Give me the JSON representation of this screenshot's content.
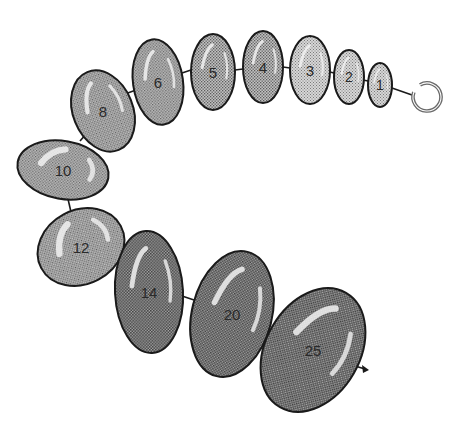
{
  "diagram": {
    "type": "bead-chain",
    "colors": {
      "outline": "#1a1a1a",
      "light_fill": "#c9c9c9",
      "medium_fill": "#a9a9a9",
      "dark_fill": "#8e8e8e",
      "highlight": "#f2f2f2",
      "ring": "#6a6a6a"
    },
    "beads": [
      {
        "label": "1",
        "cx": 380,
        "cy": 85,
        "rx": 12,
        "ry": 22,
        "rot": 0,
        "shade": "light"
      },
      {
        "label": "2",
        "cx": 349,
        "cy": 77,
        "rx": 15,
        "ry": 27,
        "rot": 0,
        "shade": "light"
      },
      {
        "label": "3",
        "cx": 310,
        "cy": 70,
        "rx": 20,
        "ry": 34,
        "rot": 0,
        "shade": "light"
      },
      {
        "label": "4",
        "cx": 263,
        "cy": 67,
        "rx": 20,
        "ry": 36,
        "rot": 0,
        "shade": "medium"
      },
      {
        "label": "5",
        "cx": 213,
        "cy": 72,
        "rx": 22,
        "ry": 38,
        "rot": 0,
        "shade": "medium"
      },
      {
        "label": "6",
        "cx": 158,
        "cy": 82,
        "rx": 25,
        "ry": 43,
        "rot": -8,
        "shade": "medium"
      },
      {
        "label": "8",
        "cx": 103,
        "cy": 111,
        "rx": 30,
        "ry": 42,
        "rot": -22,
        "shade": "medium"
      },
      {
        "label": "10",
        "cx": 63,
        "cy": 170,
        "rx": 46,
        "ry": 29,
        "rot": 10,
        "shade": "medium"
      },
      {
        "label": "12",
        "cx": 81,
        "cy": 247,
        "rx": 45,
        "ry": 37,
        "rot": -28,
        "shade": "medium"
      },
      {
        "label": "14",
        "cx": 149,
        "cy": 292,
        "rx": 34,
        "ry": 61,
        "rot": -3,
        "shade": "dark"
      },
      {
        "label": "20",
        "cx": 232,
        "cy": 314,
        "rx": 40,
        "ry": 64,
        "rot": 14,
        "shade": "dark"
      },
      {
        "label": "25",
        "cx": 313,
        "cy": 350,
        "rx": 47,
        "ry": 66,
        "rot": 30,
        "shade": "dark"
      }
    ],
    "connectors": [
      {
        "x1": 392,
        "y1": 88,
        "x2": 412,
        "y2": 95
      },
      {
        "x1": 363,
        "y1": 80,
        "x2": 368,
        "y2": 81
      },
      {
        "x1": 330,
        "y1": 72,
        "x2": 334,
        "y2": 73
      },
      {
        "x1": 283,
        "y1": 67,
        "x2": 290,
        "y2": 68
      },
      {
        "x1": 235,
        "y1": 70,
        "x2": 243,
        "y2": 69
      },
      {
        "x1": 182,
        "y1": 73,
        "x2": 191,
        "y2": 70
      },
      {
        "x1": 125,
        "y1": 94,
        "x2": 136,
        "y2": 90
      },
      {
        "x1": 80,
        "y1": 141,
        "x2": 87,
        "y2": 133
      },
      {
        "x1": 68,
        "y1": 199,
        "x2": 71,
        "y2": 212
      },
      {
        "x1": 115,
        "y1": 258,
        "x2": 122,
        "y2": 263
      },
      {
        "x1": 182,
        "y1": 296,
        "x2": 194,
        "y2": 300
      },
      {
        "x1": 262,
        "y1": 330,
        "x2": 277,
        "y2": 333
      }
    ],
    "ring": {
      "cx": 427,
      "cy": 97,
      "r": 14,
      "gap_start_deg": 200,
      "gap_end_deg": 240
    },
    "tip": {
      "x1": 355,
      "y1": 366,
      "x2": 365,
      "y2": 369
    }
  }
}
